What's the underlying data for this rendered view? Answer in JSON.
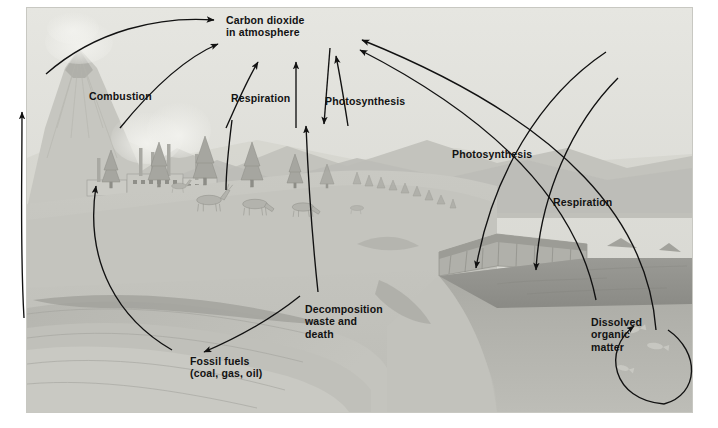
{
  "figure": {
    "style": "pencil-shaded landscape illustration, grayscale",
    "background_color": "#d9d9d4",
    "ink_color": "#111111",
    "border_color": "#c8c8c2"
  },
  "labels": [
    {
      "id": "co2",
      "text": "Carbon dioxide\nin atmosphere",
      "x": 226,
      "y": 14
    },
    {
      "id": "combustion",
      "text": "Combustion",
      "x": 89,
      "y": 90
    },
    {
      "id": "respiration_1",
      "text": "Respiration",
      "x": 231,
      "y": 92
    },
    {
      "id": "photosynthesis_1",
      "text": "Photosynthesis",
      "x": 325,
      "y": 95
    },
    {
      "id": "photosynthesis_2",
      "text": "Photosynthesis",
      "x": 452,
      "y": 148
    },
    {
      "id": "respiration_2",
      "text": "Respiration",
      "x": 553,
      "y": 196
    },
    {
      "id": "decomposition",
      "text": "Decomposition\nwaste and\ndeath",
      "x": 305,
      "y": 303
    },
    {
      "id": "fossil_fuels",
      "text": "Fossil fuels\n(coal, gas, oil)",
      "x": 190,
      "y": 355
    },
    {
      "id": "dissolved",
      "text": "Dissolved\norganic\nmatter",
      "x": 591,
      "y": 316
    }
  ],
  "scene_elements": [
    {
      "name": "volcano",
      "description": "smoking volcanic peak, upper left"
    },
    {
      "name": "mountain-range",
      "description": "hazy ridges behind volcano"
    },
    {
      "name": "factory-complex",
      "description": "industrial buildings with smokestacks emitting smoke"
    },
    {
      "name": "conifer-forest",
      "description": "stand of spruce trees on the hillside"
    },
    {
      "name": "grazing-herd",
      "description": "deer and elk grazing on the grassy slope"
    },
    {
      "name": "sedimentary-cliff",
      "description": "layered rock cliff at the shoreline"
    },
    {
      "name": "water-body",
      "description": "lake or ocean on the right"
    },
    {
      "name": "fish",
      "description": "fish swimming in the water column"
    },
    {
      "name": "soil-strata",
      "description": "underground rock and coal/oil bearing layers"
    }
  ],
  "flow_arrows": [
    {
      "id": "volcano-to-co2",
      "from": "volcano",
      "to": "carbon dioxide in atmosphere",
      "process": "volcanic outgassing"
    },
    {
      "id": "combustion-to-co2",
      "from": "factory-complex",
      "to": "carbon dioxide in atmosphere",
      "process": "Combustion"
    },
    {
      "id": "respiration-to-co2",
      "from": "animals",
      "to": "carbon dioxide in atmosphere",
      "process": "Respiration"
    },
    {
      "id": "co2-to-plants",
      "from": "carbon dioxide in atmosphere",
      "to": "trees",
      "process": "Photosynthesis"
    },
    {
      "id": "plants-to-decomposition",
      "from": "trees",
      "to": "decomposition waste and death",
      "process": "death and waste"
    },
    {
      "id": "decomposition-to-fossil",
      "from": "decomposition",
      "to": "fossil fuels",
      "process": "burial"
    },
    {
      "id": "fossil-to-combustion",
      "from": "fossil fuels",
      "to": "factory-complex",
      "process": "extraction and burning"
    },
    {
      "id": "water-photosynthesis",
      "from": "carbon dioxide in atmosphere",
      "to": "water body",
      "process": "Photosynthesis"
    },
    {
      "id": "water-respiration",
      "from": "water body",
      "to": "carbon dioxide in atmosphere",
      "process": "Respiration"
    },
    {
      "id": "dissolved-loop",
      "from": "dissolved organic matter",
      "to": "water column",
      "process": "dissolution and return"
    }
  ]
}
